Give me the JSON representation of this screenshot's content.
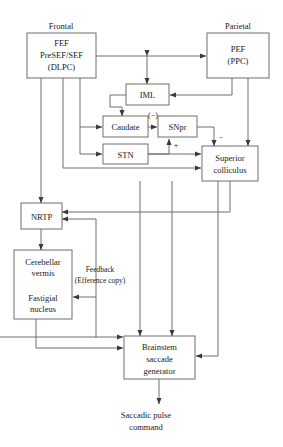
{
  "diagram": {
    "headers": {
      "frontal": "Frontal",
      "parietal": "Parietal"
    },
    "boxes": {
      "fef": {
        "line1": "FEF",
        "line2": "PreSEF/SEF",
        "line3": "(DLPC)"
      },
      "pef": {
        "line1": "PEF",
        "line2": "(PPC)"
      },
      "iml": {
        "line1": "IML"
      },
      "caudate": {
        "line1": "Caudate"
      },
      "snpr": {
        "line1": "SNpr"
      },
      "stn": {
        "line1": "STN"
      },
      "superior_colliculus": {
        "line1": "Superior",
        "line2": "colliculus"
      },
      "nrtp": {
        "line1": "NRTP"
      },
      "cerebellum": {
        "line1": "Cerebellar",
        "line2": "vermis",
        "line3": "Fastigial",
        "line4": "nucleus"
      },
      "brainstem": {
        "line1": "Brainstem",
        "line2": "saccade",
        "line3": "generator"
      }
    },
    "labels": {
      "caudate_to_snpr_sign": "(−)",
      "stn_to_snpr_sign": "+",
      "snpr_to_sc_sign": "−",
      "feedback_line1": "Feedback",
      "feedback_line2": "(Efference copy)"
    },
    "output": {
      "line1": "Saccadic pulse",
      "line2": "command"
    },
    "colors": {
      "stroke": "#6e6e6e",
      "text": "#1a1a1a",
      "background": "#ffffff"
    }
  }
}
